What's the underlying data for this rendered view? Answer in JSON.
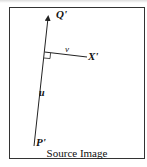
{
  "figure": {
    "caption": "Source Image",
    "labels": {
      "q_prime": "Q'",
      "p_prime": "P'",
      "x_prime": "X'",
      "u": "u",
      "v": "v"
    },
    "colors": {
      "line": "#222222",
      "border": "#333333",
      "background": "#ffffff"
    },
    "geometry": {
      "P_prime": [
        34,
        146
      ],
      "Q_prime_arrow_tip": [
        48,
        17
      ],
      "perpendicular_foot": [
        45,
        52
      ],
      "X_prime": [
        87,
        57
      ]
    }
  }
}
